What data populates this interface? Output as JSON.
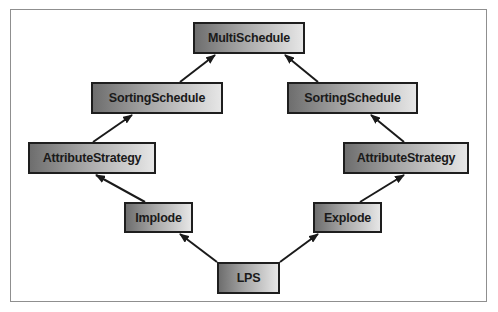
{
  "diagram": {
    "type": "inheritance-graph",
    "nodes": [
      {
        "id": "multischedule",
        "label": "MultiSchedule",
        "x": 193,
        "y": 22,
        "w": 112,
        "h": 32
      },
      {
        "id": "sorting-left",
        "label": "SortingSchedule",
        "x": 91,
        "y": 82,
        "w": 132,
        "h": 32
      },
      {
        "id": "sorting-right",
        "label": "SortingSchedule",
        "x": 287,
        "y": 82,
        "w": 131,
        "h": 32
      },
      {
        "id": "attr-left",
        "label": "AttributeStrategy",
        "x": 28,
        "y": 142,
        "w": 128,
        "h": 32
      },
      {
        "id": "attr-right",
        "label": "AttributeStrategy",
        "x": 343,
        "y": 142,
        "w": 126,
        "h": 32
      },
      {
        "id": "implode",
        "label": "Implode",
        "x": 124,
        "y": 202,
        "w": 69,
        "h": 31
      },
      {
        "id": "explode",
        "label": "Explode",
        "x": 313,
        "y": 202,
        "w": 69,
        "h": 31
      },
      {
        "id": "lps",
        "label": "LPS",
        "x": 217,
        "y": 262,
        "w": 63,
        "h": 32
      }
    ],
    "edges": [
      {
        "from": "lps",
        "to": "implode"
      },
      {
        "from": "lps",
        "to": "explode"
      },
      {
        "from": "implode",
        "to": "attr-left"
      },
      {
        "from": "explode",
        "to": "attr-right"
      },
      {
        "from": "attr-left",
        "to": "sorting-left"
      },
      {
        "from": "attr-right",
        "to": "sorting-right"
      },
      {
        "from": "sorting-left",
        "to": "multischedule"
      },
      {
        "from": "sorting-right",
        "to": "multischedule"
      }
    ],
    "colors": {
      "border": "#1e1e1e",
      "gradient_dark": "#6e6e6e",
      "gradient_light": "#e6e6e6",
      "frame": "#8f8f8f"
    }
  }
}
